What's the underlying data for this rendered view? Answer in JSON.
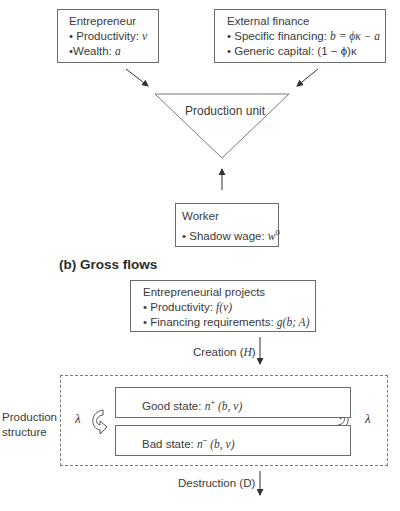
{
  "panel_a": {
    "entrepreneur": {
      "title": "Entrepreneur",
      "items": [
        {
          "label": "• Productivity: ",
          "symbol": "v"
        },
        {
          "label": "•Wealth: ",
          "symbol": "a"
        }
      ]
    },
    "external_finance": {
      "title": "External finance",
      "items": [
        {
          "label": "• Specific financing: ",
          "symbol": "b = ϕκ − a"
        },
        {
          "label": "• Generic capital: ",
          "symbol": "(1 − ϕ)κ"
        }
      ]
    },
    "production_unit": {
      "label": "Production unit"
    },
    "worker": {
      "title": "Worker",
      "items": [
        {
          "label": "• Shadow wage: ",
          "symbol": "w",
          "superscript": "0"
        }
      ]
    }
  },
  "panel_b": {
    "title": "(b) Gross flows",
    "projects": {
      "title": "Entrepreneurial projects",
      "items": [
        {
          "label": "• Productivity: ",
          "symbol": "f(v)"
        },
        {
          "label": "• Financing requirements: ",
          "symbol": "g(b; A)"
        }
      ]
    },
    "creation": {
      "label": "Creation (",
      "symbol": "H",
      "close": ")"
    },
    "production_structure": {
      "label_line1": "Production",
      "label_line2": "structure"
    },
    "good_state": {
      "label": "Good state: ",
      "symbol": "n",
      "superscript": "+",
      "args": " (b, v)"
    },
    "bad_state": {
      "label": "Bad state: ",
      "symbol": "n",
      "superscript": "−",
      "args": " (b, v)"
    },
    "transition_rate_left": "λ",
    "transition_rate_right": "λ",
    "destruction": {
      "label": "Destruction (D)"
    }
  }
}
